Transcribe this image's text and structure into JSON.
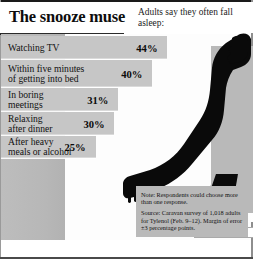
{
  "header": {
    "title": "The snooze muse",
    "subtitle": "Adults say they often fall asleep:"
  },
  "chart_data": {
    "type": "bar",
    "title": "The snooze muse",
    "subtitle": "Adults say they often fall asleep:",
    "xlabel": "",
    "ylabel": "",
    "xlim": [
      0,
      50
    ],
    "grid": false,
    "legend": "none",
    "orientation": "horizontal",
    "unit": "%",
    "categories": [
      "Watching TV",
      "Within five minutes\nof getting into bed",
      "In boring\nmeetings",
      "Relaxing\nafter dinner",
      "After heavy\nmeals or alcohol"
    ],
    "values": [
      44,
      40,
      31,
      30,
      25
    ],
    "value_labels": [
      "44%",
      "40%",
      "31%",
      "30%",
      "25%"
    ]
  },
  "note": {
    "line1": "Note: Respondents could choose more than one response.",
    "line2": "Source: Caravan survey of 1,018 adults for Tylenol (Feb. 9–12). Margin of error ±3 percentage points."
  },
  "illustration": {
    "name": "reclining-person-silhouette"
  },
  "colors": {
    "bar": "#c6c6c6",
    "panel": "#b9b9b9",
    "ink": "#111111",
    "silhouette": "#0a0a0a"
  }
}
